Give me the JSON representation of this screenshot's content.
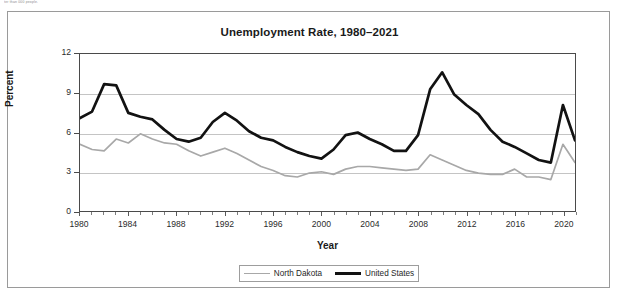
{
  "page": {
    "cut_off_header_text": "ter than 000 people."
  },
  "legend": {
    "position": "bottom-center",
    "items": [
      {
        "label": "North Dakota",
        "color": "#a8a8a8",
        "style": "thin-gray"
      },
      {
        "label": "United States",
        "color": "#121212",
        "style": "thick-black"
      }
    ]
  },
  "chart_data": {
    "type": "line",
    "title": "Unemployment Rate, 1980–2021",
    "xlabel": "Year",
    "ylabel": "Percent",
    "xlim": [
      1980,
      2021
    ],
    "ylim": [
      0,
      12
    ],
    "ytick_labels": [
      "0",
      "3",
      "6",
      "9",
      "12"
    ],
    "yticks": [
      0,
      3,
      6,
      9,
      12
    ],
    "xtick_labels": [
      "1980",
      "1984",
      "1988",
      "1992",
      "1996",
      "2000",
      "2004",
      "2008",
      "2012",
      "2016",
      "2020"
    ],
    "xticks": [
      1980,
      1984,
      1988,
      1992,
      1996,
      2000,
      2004,
      2008,
      2012,
      2016,
      2020
    ],
    "grid": "horizontal",
    "x": [
      1980,
      1981,
      1982,
      1983,
      1984,
      1985,
      1986,
      1987,
      1988,
      1989,
      1990,
      1991,
      1992,
      1993,
      1994,
      1995,
      1996,
      1997,
      1998,
      1999,
      2000,
      2001,
      2002,
      2003,
      2004,
      2005,
      2006,
      2007,
      2008,
      2009,
      2010,
      2011,
      2012,
      2013,
      2014,
      2015,
      2016,
      2017,
      2018,
      2019,
      2020,
      2021
    ],
    "series": [
      {
        "name": "North Dakota",
        "color": "#a8a8a8",
        "values": [
          5.1,
          4.7,
          4.6,
          5.5,
          5.2,
          5.9,
          5.5,
          5.2,
          5.1,
          4.6,
          4.2,
          4.5,
          4.8,
          4.4,
          3.9,
          3.4,
          3.1,
          2.7,
          2.6,
          2.9,
          3.0,
          2.8,
          3.2,
          3.4,
          3.4,
          3.3,
          3.2,
          3.1,
          3.2,
          4.3,
          3.9,
          3.5,
          3.1,
          2.9,
          2.8,
          2.8,
          3.2,
          2.6,
          2.6,
          2.4,
          5.1,
          3.7
        ]
      },
      {
        "name": "United States",
        "color": "#121212",
        "values": [
          7.1,
          7.6,
          9.7,
          9.6,
          7.5,
          7.2,
          7.0,
          6.2,
          5.5,
          5.3,
          5.6,
          6.8,
          7.5,
          6.9,
          6.1,
          5.6,
          5.4,
          4.9,
          4.5,
          4.2,
          4.0,
          4.7,
          5.8,
          6.0,
          5.5,
          5.1,
          4.6,
          4.6,
          5.8,
          9.3,
          10.6,
          8.9,
          8.1,
          7.4,
          6.2,
          5.3,
          4.9,
          4.4,
          3.9,
          3.7,
          8.1,
          5.4
        ]
      }
    ]
  }
}
